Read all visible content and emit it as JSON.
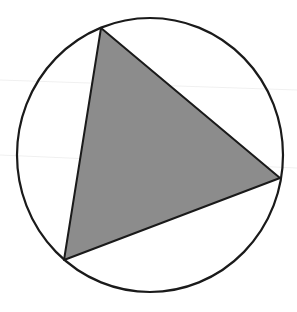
{
  "diagram": {
    "circle": {
      "cx": 150,
      "cy": 155,
      "rx": 133,
      "ry": 137,
      "stroke": "#1a1a1a",
      "stroke_width": 2.2,
      "fill": "none"
    },
    "triangle": {
      "vertices": [
        [
          101,
          28
        ],
        [
          280,
          178
        ],
        [
          64,
          260
        ]
      ],
      "fill": "#8c8c8c",
      "stroke": "#1a1a1a",
      "stroke_width": 2
    }
  }
}
